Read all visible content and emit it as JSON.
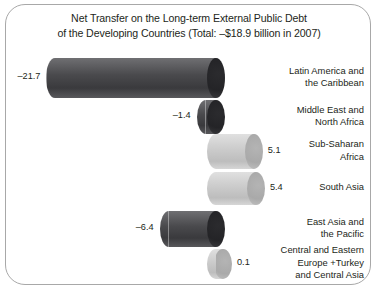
{
  "title": {
    "line1": "Net Transfer on the Long-term External Public Debt",
    "line2": "of the Developing Countries (Total: –$18.9 billion in 2007)"
  },
  "chart_data": {
    "type": "bar",
    "title": "Net Transfer on the Long-term External Public Debt of the Developing Countries (Total: –$18.9 billion in 2007)",
    "xlabel": "",
    "ylabel": "",
    "unit": "billion US$",
    "total": -18.9,
    "year": 2007,
    "orientation": "horizontal",
    "grid": false,
    "legend": false,
    "categories": [
      "Latin America and the Caribbean",
      "Middle East and North Africa",
      "Sub-Saharan Africa",
      "South Asia",
      "East Asia and the Pacific",
      "Central and Eastern Europe +Turkey and Central Asia"
    ],
    "values": [
      -21.7,
      -1.4,
      5.1,
      5.4,
      -6.4,
      0.1
    ],
    "value_labels": [
      "–21.7",
      "–1.4",
      "5.1",
      "5.4",
      "–6.4",
      "0.1"
    ],
    "category_label_lines": [
      [
        "Latin America and",
        "the Caribbean"
      ],
      [
        "Middle East and",
        "North Africa"
      ],
      [
        "Sub-Saharan",
        "Africa"
      ],
      [
        "South Asia"
      ],
      [
        "East Asia and",
        "the Pacific"
      ],
      [
        "Central and Eastern",
        "Europe +Turkey",
        "and Central Asia"
      ]
    ],
    "colors": {
      "negative": "#4d4d4f",
      "positive": "#c9c9c9",
      "border": "#a8a8a8",
      "text": "#231f20"
    }
  }
}
